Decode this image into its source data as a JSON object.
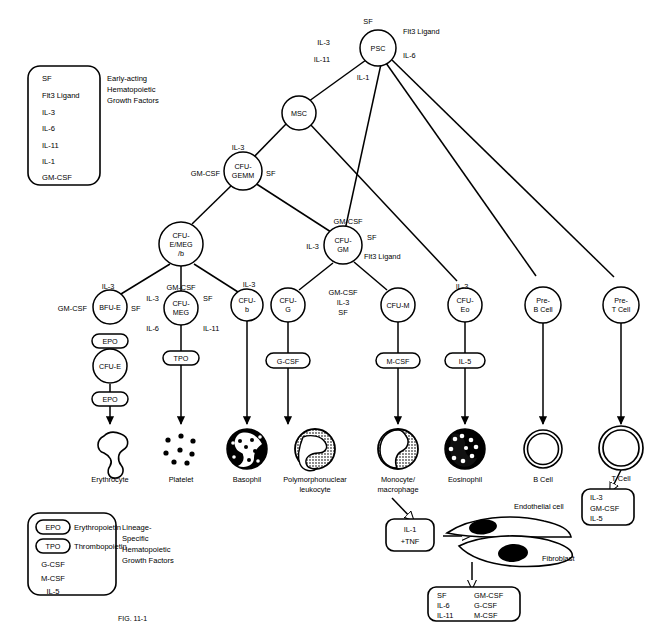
{
  "figure": {
    "caption": "FIG. 11-1"
  },
  "legend_top": {
    "caption_lines": [
      "Early-acting",
      "Hematopoietic",
      "Growth Factors"
    ],
    "items": [
      "SF",
      "Flt3 Ligand",
      "IL-3",
      "IL-6",
      "IL-11",
      "IL-1",
      "GM-CSF"
    ]
  },
  "legend_bottom": {
    "caption_lines": [
      "Lineage-",
      "Specific",
      "Hematopoietic",
      "Growth Factors"
    ],
    "items": [
      {
        "symbol": "EPO",
        "pill": true,
        "name": "Erythropoietin"
      },
      {
        "symbol": "TPO",
        "pill": true,
        "name": "Thrombopoietin"
      },
      {
        "symbol": "G-CSF",
        "pill": false,
        "name": ""
      },
      {
        "symbol": "M-CSF",
        "pill": false,
        "name": ""
      },
      {
        "symbol": "IL-5",
        "pill": false,
        "name": ""
      }
    ]
  },
  "nodes": {
    "psc": {
      "label": "PSC",
      "lines": [
        "PSC"
      ]
    },
    "msc": {
      "label": "MSC",
      "lines": [
        "MSC"
      ]
    },
    "cfu_gemm": {
      "label": "CFU-GEMM",
      "lines": [
        "CFU-",
        "GEMM"
      ]
    },
    "cfu_emegb": {
      "label": "CFU-E/MEG/b",
      "lines": [
        "CFU-",
        "E/MEG",
        "/b"
      ]
    },
    "bfu_e": {
      "label": "BFU-E",
      "lines": [
        "BFU-E"
      ]
    },
    "cfu_e": {
      "label": "CFU-E",
      "lines": [
        "CFU-E"
      ]
    },
    "cfu_meg": {
      "label": "CFU-MEG",
      "lines": [
        "CFU-",
        "MEG"
      ]
    },
    "cfu_b": {
      "label": "CFU-b",
      "lines": [
        "CFU-",
        "b"
      ]
    },
    "cfu_gm": {
      "label": "CFU-GM",
      "lines": [
        "CFU-",
        "GM"
      ]
    },
    "cfu_g": {
      "label": "CFU-G",
      "lines": [
        "CFU-",
        "G"
      ]
    },
    "cfu_m": {
      "label": "CFU-M",
      "lines": [
        "CFU-M"
      ]
    },
    "cfu_eo": {
      "label": "CFU-Eo",
      "lines": [
        "CFU-",
        "Eo"
      ]
    },
    "pre_b": {
      "label": "Pre-B Cell",
      "lines": [
        "Pre-",
        "B Cell"
      ]
    },
    "pre_t": {
      "label": "Pre-T Cell",
      "lines": [
        "Pre-",
        "T Cell"
      ]
    }
  },
  "edge_factors": {
    "psc_left_top": "IL-3",
    "psc_left_bottom": "IL-11",
    "psc_top": "SF",
    "psc_right_top": "Flt3 Ligand",
    "psc_right_bottom": "IL-6",
    "psc_bottom": "IL-1",
    "gemm_top": "IL-3",
    "gemm_left": "GM-CSF",
    "gemm_right": "SF",
    "bfu_top": "IL-3",
    "bfu_left": "GM-CSF",
    "bfu_right": "SF",
    "meg_top": "GM-CSF",
    "meg_left": "IL-3",
    "meg_right": "SF",
    "meg_lower_left": "IL-6",
    "meg_lower_right": "IL-11",
    "cfub_top": "IL-3",
    "gm_top": "GM-CSF",
    "gm_left": "IL-3",
    "gm_right_top": "SF",
    "gm_right_bottom": "Flt3 Ligand",
    "gm_mid": [
      "GM-CSF",
      "IL-3",
      "SF"
    ],
    "eo_top": "IL-3"
  },
  "pills": {
    "epo_1": "EPO",
    "epo_2": "EPO",
    "tpo": "TPO",
    "gcsf": "G-CSF",
    "mcsf": "M-CSF",
    "il5": "IL-5"
  },
  "mature_cells": [
    {
      "id": "erythrocyte",
      "label": "Erythrocyte",
      "lines": [
        "Erythrocyte"
      ]
    },
    {
      "id": "platelet",
      "label": "Platelet",
      "lines": [
        "Platelet"
      ]
    },
    {
      "id": "basophil",
      "label": "Basophil",
      "lines": [
        "Basophil"
      ]
    },
    {
      "id": "pmn",
      "label": "Polymorphonuclear leukocyte",
      "lines": [
        "Polymorphonuclear",
        "leukocyte"
      ]
    },
    {
      "id": "monocyte",
      "label": "Monocyte/macrophage",
      "lines": [
        "Monocyte/",
        "macrophage"
      ]
    },
    {
      "id": "eosinophil",
      "label": "Eosinophil",
      "lines": [
        "Eosinophil"
      ]
    },
    {
      "id": "bcell",
      "label": "B Cell",
      "lines": [
        "B Cell"
      ]
    },
    {
      "id": "tcell",
      "label": "T Cell",
      "lines": [
        "T Cell"
      ]
    }
  ],
  "feedback": {
    "il1_tnf_box": [
      "IL-1",
      "+TNF"
    ],
    "endothelial_label": "Endothelial cell",
    "fibroblast_label": "Fibroblast",
    "stromal_output": {
      "col1": [
        "SF",
        "IL-6",
        "IL-11"
      ],
      "col2": [
        "GM-CSF",
        "G-CSF",
        "M-CSF"
      ]
    },
    "tcell_output": [
      "IL-3",
      "GM-CSF",
      "IL-5"
    ]
  }
}
